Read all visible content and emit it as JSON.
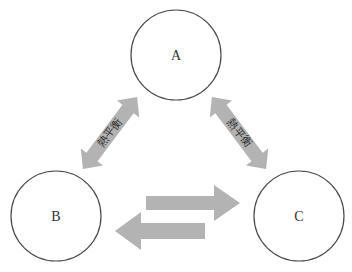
{
  "diagram": {
    "type": "relationship",
    "nodes": [
      {
        "id": "A",
        "label": "A"
      },
      {
        "id": "B",
        "label": "B"
      },
      {
        "id": "C",
        "label": "C"
      }
    ],
    "edges": [
      {
        "from": "A",
        "to": "B",
        "direction": "bidirectional",
        "label": "熱平衡"
      },
      {
        "from": "A",
        "to": "C",
        "direction": "bidirectional",
        "label": "熱平衡"
      },
      {
        "from": "B",
        "to": "C",
        "direction": "forward",
        "label": ""
      },
      {
        "from": "C",
        "to": "B",
        "direction": "forward",
        "label": ""
      }
    ],
    "colors": {
      "arrow": "#b3b3b3",
      "circle_stroke": "#4a4a4a",
      "text": "#333333"
    }
  }
}
